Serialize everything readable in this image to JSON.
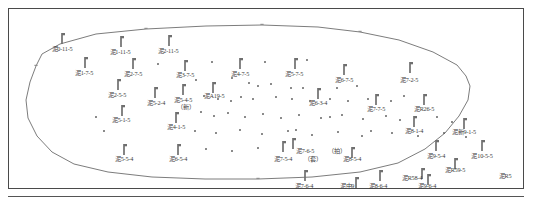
{
  "figure": {
    "title": "",
    "type": "well-location-map",
    "frame": {
      "x": 8,
      "y": 8,
      "width": 516,
      "height": 181,
      "border_color": "#4a4a4a"
    },
    "colors": {
      "boundary": "#6d6d6d",
      "well_symbol": "#6f6f6f",
      "dot": "#5a5a5a",
      "label_text": "#3b3b3b",
      "frame": "#4a4a4a",
      "background": "#ffffff"
    }
  },
  "boundary": {
    "name": "field-outline-polygon",
    "points": "60,44 96,34 146,29 206,26 262,25 318,27 360,32 399,40 433,52 457,65 466,76 470,86 468,100 459,116 445,133 425,149 398,163 360,172 312,177 258,179 205,179 152,177 108,172 74,164 52,152 37,136 28,118 26,100 30,82 36,66 42,54",
    "vertex_markers": [
      {
        "x": 146,
        "y": 29
      },
      {
        "x": 262,
        "y": 25
      },
      {
        "x": 360,
        "y": 32
      },
      {
        "x": 36,
        "y": 66
      },
      {
        "x": 258,
        "y": 179
      }
    ]
  },
  "wells": [
    {
      "id": "w01",
      "label": "泥0-11-5",
      "x": 62,
      "y": 33,
      "label_x": 62,
      "label_y": 45
    },
    {
      "id": "w02",
      "label": "泥1-11-5",
      "x": 121,
      "y": 36,
      "label_x": 120,
      "label_y": 48
    },
    {
      "id": "w03",
      "label": "泥2-11-5",
      "x": 169,
      "y": 35,
      "label_x": 168,
      "label_y": 47
    },
    {
      "id": "w04",
      "label": "泥1-7-5",
      "x": 85,
      "y": 57,
      "label_x": 84,
      "label_y": 69
    },
    {
      "id": "w05",
      "label": "泥2-7-5",
      "x": 133,
      "y": 58,
      "label_x": 133,
      "label_y": 70
    },
    {
      "id": "w06",
      "label": "泥3-7-5",
      "x": 185,
      "y": 60,
      "label_x": 185,
      "label_y": 71
    },
    {
      "id": "w07",
      "label": "泥4-7-5",
      "x": 240,
      "y": 58,
      "label_x": 240,
      "label_y": 70
    },
    {
      "id": "w08",
      "label": "泥5-7-5",
      "x": 295,
      "y": 58,
      "label_x": 294,
      "label_y": 70
    },
    {
      "id": "w09",
      "label": "泥6-7-5",
      "x": 344,
      "y": 64,
      "label_x": 344,
      "label_y": 76
    },
    {
      "id": "w10",
      "label": "泥7-2-5",
      "x": 410,
      "y": 62,
      "label_x": 409,
      "label_y": 76
    },
    {
      "id": "w11",
      "label": "泥2-5-5",
      "x": 118,
      "y": 79,
      "label_x": 117,
      "label_y": 91
    },
    {
      "id": "w12",
      "label": "泥5-2-4",
      "x": 155,
      "y": 87,
      "label_x": 156,
      "label_y": 99
    },
    {
      "id": "w13",
      "label": "泥5-4-5",
      "x": 183,
      "y": 84,
      "label_x": 183,
      "label_y": 96
    },
    {
      "id": "w14",
      "label": "（新）",
      "x": 0,
      "y": 0,
      "label_x": 186,
      "label_y": 103
    },
    {
      "id": "w15",
      "label": "泥A19-5",
      "x": 213,
      "y": 82,
      "label_x": 214,
      "label_y": 92
    },
    {
      "id": "w16",
      "label": "泥5-1-5",
      "x": 122,
      "y": 105,
      "label_x": 121,
      "label_y": 116
    },
    {
      "id": "w17",
      "label": "泥4-1-5",
      "x": 176,
      "y": 112,
      "label_x": 176,
      "label_y": 123
    },
    {
      "id": "w18",
      "label": "泥6-3-4",
      "x": 318,
      "y": 88,
      "label_x": 318,
      "label_y": 99
    },
    {
      "id": "w19",
      "label": "泥7-7-5",
      "x": 376,
      "y": 94,
      "label_x": 376,
      "label_y": 105
    },
    {
      "id": "w20",
      "label": "泥R26-5",
      "x": 424,
      "y": 94,
      "label_x": 424,
      "label_y": 105
    },
    {
      "id": "w21",
      "label": "泥8-1-4",
      "x": 414,
      "y": 116,
      "label_x": 414,
      "label_y": 127
    },
    {
      "id": "w22",
      "label": "泥新9-1-5",
      "x": 464,
      "y": 118,
      "label_x": 464,
      "label_y": 128
    },
    {
      "id": "w23",
      "label": "泥5-5-4",
      "x": 124,
      "y": 144,
      "label_x": 124,
      "label_y": 155
    },
    {
      "id": "w24",
      "label": "泥6-5-4",
      "x": 178,
      "y": 144,
      "label_x": 178,
      "label_y": 155
    },
    {
      "id": "w25",
      "label": "泥7-6-5",
      "x": 293,
      "y": 138,
      "label_x": 305,
      "label_y": 147
    },
    {
      "id": "w26",
      "label": "（拍）",
      "x": 0,
      "y": 0,
      "label_x": 337,
      "label_y": 147
    },
    {
      "id": "w27",
      "label": "泥7-5-4",
      "x": 283,
      "y": 141,
      "label_x": 283,
      "label_y": 155
    },
    {
      "id": "w28",
      "label": "（套）",
      "x": 0,
      "y": 0,
      "label_x": 313,
      "label_y": 155
    },
    {
      "id": "w29",
      "label": "泥8-5-4",
      "x": 352,
      "y": 147,
      "label_x": 352,
      "label_y": 155
    },
    {
      "id": "w30",
      "label": "泥9-5-4",
      "x": 436,
      "y": 140,
      "label_x": 436,
      "label_y": 152
    },
    {
      "id": "w31",
      "label": "泥10-5-5",
      "x": 482,
      "y": 140,
      "label_x": 482,
      "label_y": 152
    },
    {
      "id": "w32",
      "label": "泥R59-5",
      "x": 455,
      "y": 158,
      "label_x": 455,
      "label_y": 166
    },
    {
      "id": "w33",
      "label": "泥7-6-4",
      "x": 305,
      "y": 170,
      "label_x": 304,
      "label_y": 182
    },
    {
      "id": "w34",
      "label": "泥中9",
      "x": 356,
      "y": 177,
      "label_x": 347,
      "label_y": 182
    },
    {
      "id": "w35",
      "label": "泥8-6-4",
      "x": 380,
      "y": 170,
      "label_x": 378,
      "label_y": 182
    },
    {
      "id": "w36",
      "label": "泥R58-4",
      "x": 422,
      "y": 168,
      "label_x": 412,
      "label_y": 174
    },
    {
      "id": "w37",
      "label": "泥9-6-4",
      "x": 428,
      "y": 174,
      "label_x": 427,
      "label_y": 182
    },
    {
      "id": "w38",
      "label": "泥R5",
      "x": 0,
      "y": 0,
      "label_x": 505,
      "label_y": 172
    }
  ],
  "dots": [
    {
      "x": 158,
      "y": 64
    },
    {
      "x": 212,
      "y": 62
    },
    {
      "x": 265,
      "y": 62
    },
    {
      "x": 307,
      "y": 60
    },
    {
      "x": 196,
      "y": 80
    },
    {
      "x": 232,
      "y": 78
    },
    {
      "x": 249,
      "y": 83
    },
    {
      "x": 258,
      "y": 86
    },
    {
      "x": 271,
      "y": 84
    },
    {
      "x": 291,
      "y": 88
    },
    {
      "x": 303,
      "y": 88
    },
    {
      "x": 337,
      "y": 88
    },
    {
      "x": 357,
      "y": 86
    },
    {
      "x": 204,
      "y": 96
    },
    {
      "x": 218,
      "y": 99
    },
    {
      "x": 231,
      "y": 101
    },
    {
      "x": 241,
      "y": 97
    },
    {
      "x": 253,
      "y": 99
    },
    {
      "x": 276,
      "y": 97
    },
    {
      "x": 292,
      "y": 99
    },
    {
      "x": 310,
      "y": 101
    },
    {
      "x": 330,
      "y": 99
    },
    {
      "x": 348,
      "y": 101
    },
    {
      "x": 368,
      "y": 99
    },
    {
      "x": 391,
      "y": 101
    },
    {
      "x": 404,
      "y": 96
    },
    {
      "x": 201,
      "y": 112
    },
    {
      "x": 214,
      "y": 116
    },
    {
      "x": 228,
      "y": 113
    },
    {
      "x": 245,
      "y": 117
    },
    {
      "x": 263,
      "y": 114
    },
    {
      "x": 281,
      "y": 118
    },
    {
      "x": 299,
      "y": 115
    },
    {
      "x": 321,
      "y": 118
    },
    {
      "x": 342,
      "y": 115
    },
    {
      "x": 363,
      "y": 119
    },
    {
      "x": 386,
      "y": 116
    },
    {
      "x": 400,
      "y": 120
    },
    {
      "x": 437,
      "y": 117
    },
    {
      "x": 452,
      "y": 122
    },
    {
      "x": 195,
      "y": 131
    },
    {
      "x": 216,
      "y": 133
    },
    {
      "x": 240,
      "y": 130
    },
    {
      "x": 262,
      "y": 134
    },
    {
      "x": 288,
      "y": 131
    },
    {
      "x": 312,
      "y": 135
    },
    {
      "x": 338,
      "y": 132
    },
    {
      "x": 362,
      "y": 136
    },
    {
      "x": 392,
      "y": 133
    },
    {
      "x": 418,
      "y": 136
    },
    {
      "x": 444,
      "y": 133
    },
    {
      "x": 466,
      "y": 137
    },
    {
      "x": 206,
      "y": 149
    },
    {
      "x": 232,
      "y": 151
    },
    {
      "x": 258,
      "y": 148
    },
    {
      "x": 296,
      "y": 130
    },
    {
      "x": 330,
      "y": 117
    },
    {
      "x": 371,
      "y": 131
    },
    {
      "x": 96,
      "y": 117
    },
    {
      "x": 104,
      "y": 131
    }
  ]
}
